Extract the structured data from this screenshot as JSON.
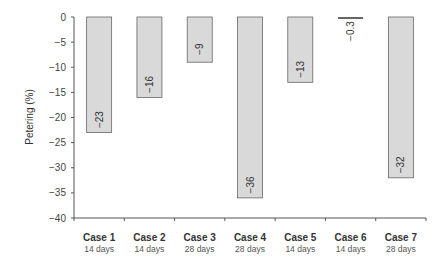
{
  "chart_data": {
    "type": "bar",
    "title": "",
    "xlabel": "",
    "ylabel": "Petering (%)",
    "ylim": [
      -40,
      0
    ],
    "yticks": [
      0,
      -5,
      -10,
      -15,
      -20,
      -25,
      -30,
      -35,
      -40
    ],
    "grid": false,
    "legend": null,
    "categories": [
      "Case 1",
      "Case 2",
      "Case 3",
      "Case 4",
      "Case 5",
      "Case 6",
      "Case 7"
    ],
    "subcategories": [
      "14 days",
      "14 days",
      "28 days",
      "28 days",
      "14 days",
      "14 days",
      "28 days"
    ],
    "values": [
      -23,
      -16,
      -9,
      -36,
      -13,
      -0.3,
      -32
    ],
    "value_labels": [
      "−23",
      "−16",
      "−9",
      "−36",
      "−13",
      "−0.3",
      "−32"
    ],
    "colors": {
      "bar_fill": "#d9d9d9",
      "bar_stroke": "#666666",
      "axis": "#555555",
      "text": "#333333"
    }
  }
}
